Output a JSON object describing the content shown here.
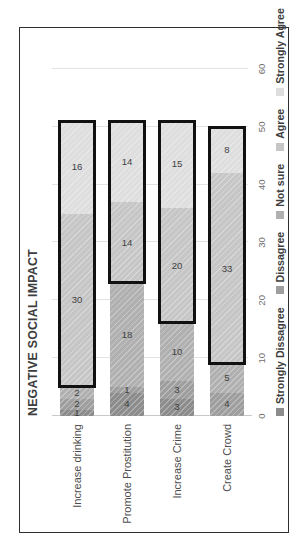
{
  "chart_data": {
    "type": "bar",
    "orientation": "horizontal-stacked",
    "title": "NEGATIVE SOCIAL IMPACT",
    "xlabel": "",
    "ylabel": "",
    "xlim": [
      0,
      60
    ],
    "xticks": [
      "0",
      "10",
      "20",
      "30",
      "40",
      "50",
      "60"
    ],
    "grid": true,
    "legend_position": "bottom",
    "categories": [
      "Increase drinking",
      "Promote Prostitution",
      "Increase Crime",
      "Create Crowd"
    ],
    "series": [
      {
        "name": "Strongly Dissagree",
        "color": "#8c8c8c",
        "values": [
          1,
          4,
          3,
          0
        ],
        "labels": [
          "1",
          "4",
          "3",
          "0"
        ]
      },
      {
        "name": "Dissagree",
        "color": "#9e9e9e",
        "values": [
          2,
          1,
          3,
          4
        ],
        "labels": [
          "2",
          "1",
          "3",
          "4"
        ]
      },
      {
        "name": "Not sure",
        "color": "#b0b0b0",
        "values": [
          2,
          18,
          10,
          5
        ],
        "labels": [
          "2",
          "18",
          "10",
          "5"
        ]
      },
      {
        "name": "Agree",
        "color": "#c6c6c6",
        "values": [
          30,
          14,
          20,
          33
        ],
        "labels": [
          "30",
          "14",
          "20",
          "33"
        ]
      },
      {
        "name": "Strongly Agree",
        "color": "#dedede",
        "values": [
          16,
          14,
          15,
          8
        ],
        "labels": [
          "16",
          "14",
          "15",
          "8"
        ]
      }
    ],
    "highlights": [
      {
        "category": "Increase drinking",
        "from_value": 5,
        "to_value": 51
      },
      {
        "category": "Promote Prostitution",
        "from_value": 23,
        "to_value": 51
      },
      {
        "category": "Increase Crime",
        "from_value": 16,
        "to_value": 51
      },
      {
        "category": "Create Crowd",
        "from_value": 9,
        "to_value": 50
      }
    ]
  },
  "legend": {
    "items": [
      {
        "label": "Strongly Dissagree",
        "color": "#8c8c8c"
      },
      {
        "label": "Dissagree",
        "color": "#9e9e9e"
      },
      {
        "label": "Not sure",
        "color": "#b0b0b0"
      },
      {
        "label": "Agree",
        "color": "#c6c6c6"
      },
      {
        "label": "Strongly Agree",
        "color": "#dedede"
      }
    ]
  }
}
